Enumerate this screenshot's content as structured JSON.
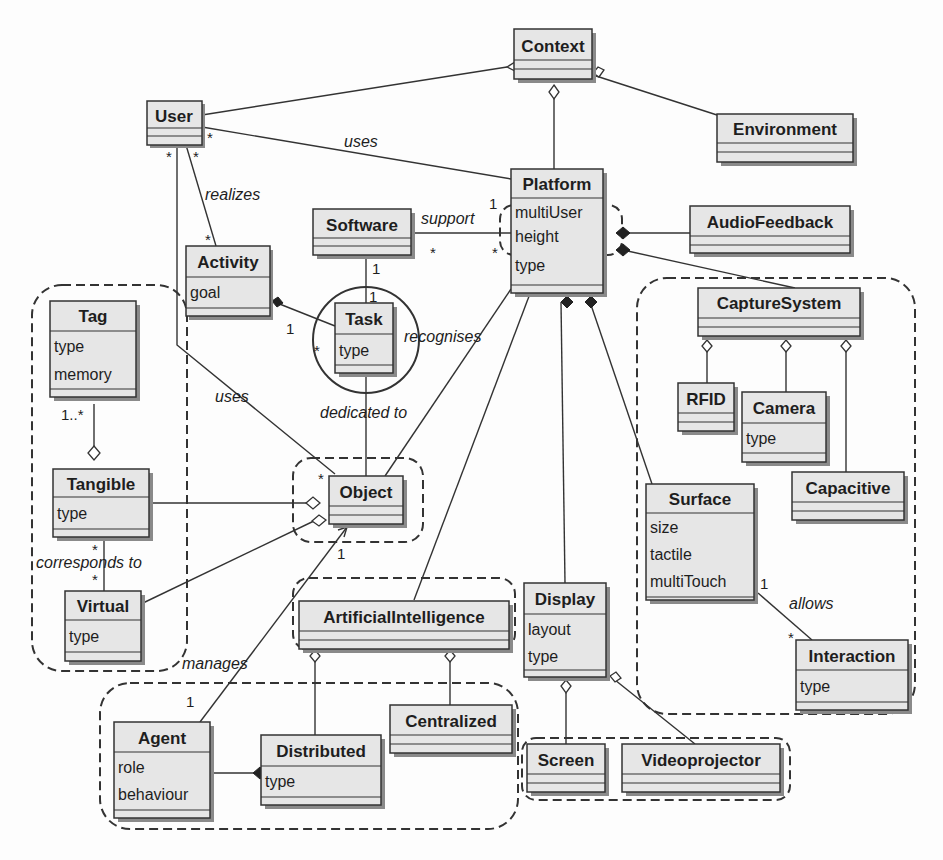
{
  "diagram": {
    "type": "UML class diagram",
    "classes": {
      "context": {
        "name": "Context",
        "attrs": []
      },
      "user": {
        "name": "User",
        "attrs": []
      },
      "environment": {
        "name": "Environment",
        "attrs": []
      },
      "platform": {
        "name": "Platform",
        "attrs": [
          "multiUser",
          "height",
          "type"
        ]
      },
      "software": {
        "name": "Software",
        "attrs": []
      },
      "audiofeedback": {
        "name": "AudioFeedback",
        "attrs": []
      },
      "activity": {
        "name": "Activity",
        "attrs": [
          "goal"
        ]
      },
      "task": {
        "name": "Task",
        "attrs": [
          "type"
        ]
      },
      "tag": {
        "name": "Tag",
        "attrs": [
          "type",
          "memory"
        ]
      },
      "capturesystem": {
        "name": "CaptureSystem",
        "attrs": []
      },
      "rfid": {
        "name": "RFID",
        "attrs": []
      },
      "camera": {
        "name": "Camera",
        "attrs": [
          "type"
        ]
      },
      "capacitive": {
        "name": "Capacitive",
        "attrs": []
      },
      "tangible": {
        "name": "Tangible",
        "attrs": [
          "type"
        ]
      },
      "object": {
        "name": "Object",
        "attrs": []
      },
      "surface": {
        "name": "Surface",
        "attrs": [
          "size",
          "tactile",
          "multiTouch"
        ]
      },
      "virtual": {
        "name": "Virtual",
        "attrs": [
          "type"
        ]
      },
      "ai": {
        "name": "ArtificialIntelligence",
        "attrs": []
      },
      "display": {
        "name": "Display",
        "attrs": [
          "layout",
          "type"
        ]
      },
      "interaction": {
        "name": "Interaction",
        "attrs": [
          "type"
        ]
      },
      "centralized": {
        "name": "Centralized",
        "attrs": []
      },
      "agent": {
        "name": "Agent",
        "attrs": [
          "role",
          "behaviour"
        ]
      },
      "distributed": {
        "name": "Distributed",
        "attrs": [
          "type"
        ]
      },
      "screen": {
        "name": "Screen",
        "attrs": []
      },
      "videoprojector": {
        "name": "Videoprojector",
        "attrs": []
      }
    },
    "associations": {
      "uses_platform": "uses",
      "realizes": "realizes",
      "support": "support",
      "recognises": "recognises",
      "uses_object": "uses",
      "dedicated_to": "dedicated to",
      "corresponds_to": "corresponds to",
      "manages": "manages",
      "allows": "allows"
    },
    "multiplicities": {
      "user_star_a": "*",
      "user_star_b": "*",
      "user_star_c": "*",
      "activity_star": "*",
      "platform_one": "1",
      "software_star": "*",
      "platform_star": "*",
      "software_one": "1",
      "task_one": "1",
      "activity_one": "1",
      "task_star": "*",
      "tag_one_many": "1..*",
      "object_star": "*",
      "object_one": "1",
      "tangible_star": "*",
      "virtual_star": "*",
      "agent_one": "1",
      "surface_one": "1",
      "interaction_star": "*"
    }
  }
}
